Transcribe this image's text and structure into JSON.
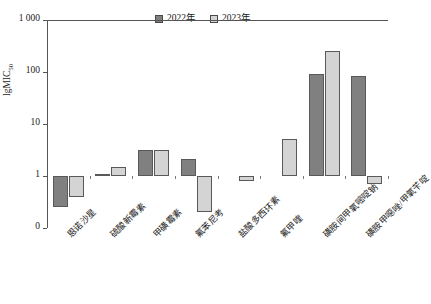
{
  "chart_data": {
    "type": "bar",
    "title": "",
    "subtitle": "",
    "xlabel": "",
    "ylabel": "lgMIC50",
    "ylabel_base": "lgMIC",
    "ylabel_sub": "50",
    "yscale": "log",
    "ylim": [
      0.1,
      1000
    ],
    "baseline": 1,
    "grid": false,
    "legend_position": "top-center",
    "ytick_labels": [
      "1 000",
      "100",
      "10",
      "1",
      "0"
    ],
    "ytick_values": [
      1000,
      100,
      10,
      1,
      0
    ],
    "categories": [
      "恩诺沙星",
      "硫酸新霉素",
      "甲磺霉素",
      "氟苯尼考",
      "盐酸多西环素",
      "氟甲喹",
      "磺胺间甲氧嘧啶钠",
      "磺胺甲噁唑/甲氧苄啶"
    ],
    "series": [
      {
        "name": "2022年",
        "color": "#808080",
        "values": [
          0.25,
          1.1,
          3.2,
          2.1,
          1.0,
          1.0,
          90,
          85
        ]
      },
      {
        "name": "2023年",
        "color": "#d4d4d4",
        "values": [
          0.4,
          1.5,
          3.2,
          0.2,
          0.8,
          5.2,
          250,
          0.7
        ]
      }
    ]
  },
  "legend": {
    "entries": [
      {
        "label": "2022年",
        "color": "#808080"
      },
      {
        "label": "2023年",
        "color": "#d4d4d4"
      }
    ]
  },
  "colors": {
    "series_2022": "#808080",
    "series_2023": "#d4d4d4",
    "axis": "#555555",
    "bar_stroke": "#595959",
    "background": "#ffffff"
  }
}
